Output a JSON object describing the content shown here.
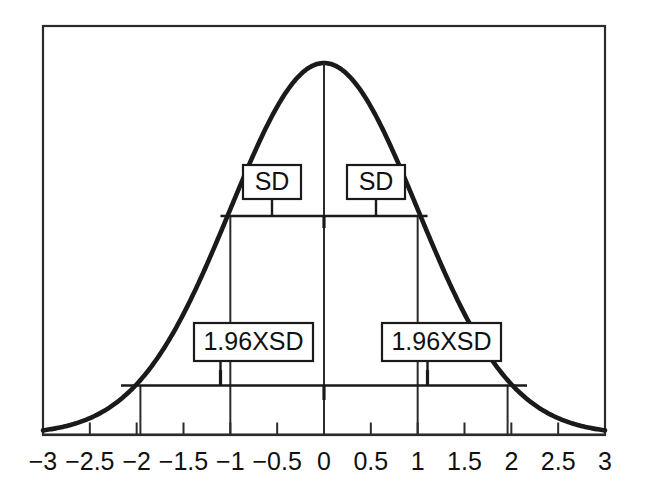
{
  "chart_data": {
    "type": "line",
    "title": "",
    "subtitle": "",
    "xlabel": "",
    "ylabel": "",
    "grid": false,
    "legend_position": "none",
    "xlim": [
      -3,
      3
    ],
    "ylim": [
      0,
      1
    ],
    "x_ticks": [
      -3,
      -2.5,
      -2,
      -1.5,
      -1,
      -0.5,
      0,
      0.5,
      1,
      1.5,
      2,
      2.5,
      3
    ],
    "x_tick_labels": [
      "-3",
      "-2.5",
      "-2",
      "-1.5",
      "-1",
      "-0.5",
      "0",
      "0.5",
      "1",
      "1.5",
      "2",
      "2.5",
      "3"
    ],
    "y_ticks": [],
    "y_tick_labels": [],
    "series": [
      {
        "name": "standard normal density",
        "curve": "gaussian",
        "mean": 0,
        "sd": 1,
        "peak_value": 1,
        "x": [
          -3,
          -2.75,
          -2.5,
          -2.25,
          -2,
          -1.75,
          -1.5,
          -1.25,
          -1,
          -0.75,
          -0.5,
          -0.25,
          0,
          0.25,
          0.5,
          0.75,
          1,
          1.25,
          1.5,
          1.75,
          2,
          2.25,
          2.5,
          2.75,
          3
        ],
        "values": [
          0.011,
          0.023,
          0.044,
          0.079,
          0.135,
          0.216,
          0.325,
          0.458,
          0.607,
          0.755,
          0.882,
          0.969,
          1,
          0.969,
          0.882,
          0.755,
          0.607,
          0.458,
          0.325,
          0.216,
          0.135,
          0.079,
          0.044,
          0.023,
          0.011
        ]
      }
    ],
    "annotations": [
      {
        "id": "sd-left",
        "label": "SD",
        "from": -1,
        "to": 0,
        "level": "upper"
      },
      {
        "id": "sd-right",
        "label": "SD",
        "from": 0,
        "to": 1,
        "level": "upper"
      },
      {
        "id": "ci-left",
        "label": "1.96XSD",
        "from": -1.96,
        "to": 0,
        "level": "lower"
      },
      {
        "id": "ci-right",
        "label": "1.96XSD",
        "from": 0,
        "to": 1.96,
        "level": "lower"
      }
    ],
    "markers": {
      "sd_bracket_span": [
        -1,
        1
      ],
      "ci_bracket_span": [
        -1.96,
        1.96
      ],
      "vertical_guides": [
        -1.96,
        -1,
        0,
        1,
        1.96
      ]
    },
    "colors": {
      "curve": "#1a1a1a",
      "frame": "#2b2b2b",
      "annotation": "#1a1a1a",
      "background": "#ffffff",
      "text": "#111111"
    }
  },
  "labels": {
    "sd_left": "SD",
    "sd_right": "SD",
    "ci_left": "1.96XSD",
    "ci_right": "1.96XSD"
  }
}
